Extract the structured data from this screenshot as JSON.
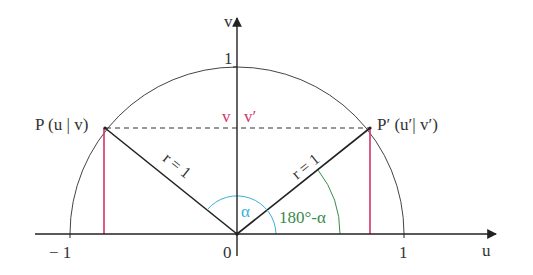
{
  "diagram": {
    "colors": {
      "axis": "#222222",
      "circle": "#444444",
      "radius": "#222222",
      "vertical_lines": "#d6336c",
      "alpha_arc": "#3ab0d8",
      "supplement_arc": "#3a8a4a",
      "vv_labels": "#d6336c",
      "text": "#333333"
    },
    "axes": {
      "u_label": "u",
      "v_label": "v",
      "u_ticks": [
        {
          "label": "− 1",
          "value": -1
        },
        {
          "label": "0",
          "value": 0
        },
        {
          "label": "1",
          "value": 1
        }
      ],
      "v_ticks": [
        {
          "label": "1",
          "value": 1
        }
      ]
    },
    "points": {
      "P": {
        "label": "P (u | v)"
      },
      "P_prime": {
        "label": "P′ (u′| v′)"
      }
    },
    "radius_labels": {
      "left": "r = 1",
      "right": "r = 1"
    },
    "height_labels": {
      "v": "v",
      "v_prime": "v′"
    },
    "angles": {
      "alpha": "α",
      "supplement": "180°-α"
    }
  }
}
